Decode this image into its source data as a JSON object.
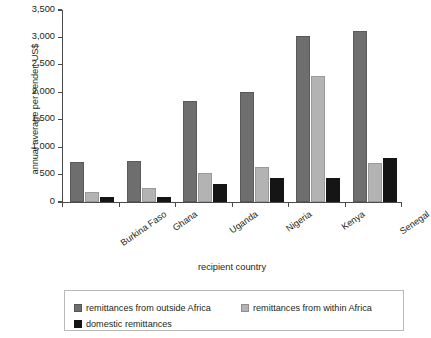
{
  "chart_data": {
    "type": "bar",
    "title": "",
    "xlabel": "recipient country",
    "ylabel": "annual average per sender, US$",
    "categories": [
      "Burkina Faso",
      "Ghana",
      "Uganda",
      "Nigeria",
      "Kenya",
      "Senegal"
    ],
    "series": [
      {
        "name": "remittances from outside Africa",
        "color": "#6e6e6e",
        "values": [
          730,
          750,
          1850,
          2000,
          3020,
          3110
        ]
      },
      {
        "name": "remittances from within Africa",
        "color": "#b3b3b3",
        "values": [
          190,
          250,
          520,
          630,
          2290,
          720
        ]
      },
      {
        "name": "domestic remittances",
        "color": "#151515",
        "values": [
          85,
          100,
          320,
          430,
          430,
          800
        ]
      }
    ],
    "ylim": [
      0,
      3500
    ],
    "yticks": [
      0,
      500,
      1000,
      1500,
      2000,
      2500,
      3000,
      3500
    ],
    "ytick_labels": [
      "0",
      "500",
      "1,000",
      "1,500",
      "2,000",
      "2,500",
      "3,000",
      "3,500"
    ],
    "grid": false,
    "legend_position": "bottom"
  },
  "legend": {
    "items": [
      {
        "label": "remittances from outside Africa",
        "swatch": "dark-gray-swatch"
      },
      {
        "label": "remittances from within Africa",
        "swatch": "light-gray-swatch"
      },
      {
        "label": "domestic remittances",
        "swatch": "black-swatch"
      }
    ]
  }
}
